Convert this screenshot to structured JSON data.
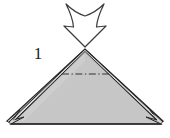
{
  "figure": {
    "step_label": "1",
    "background_color": "#ffffff",
    "paper_fill_color": "#c4c4c4",
    "paper_fill_color_light": "#cccccc",
    "outline_color": "#262626",
    "crease_line_color": "#3a3a3a",
    "arrow_fill_color": "#ffffff",
    "arrow_outline_color": "#3d3d3d"
  },
  "shapes": {
    "arrow": {
      "name": "fold-direction-arrow",
      "direction": "down",
      "style": "hollow-outlined",
      "top_notch": "concave",
      "tip_x": 85,
      "tip_y": 47,
      "top_y": 4,
      "left_barb_x": 64,
      "right_barb_x": 106
    },
    "triangle": {
      "name": "folded-paper-triangle",
      "apex_x": 85,
      "apex_y": 51,
      "left_base_x": 11,
      "left_base_y": 124,
      "right_base_x": 161,
      "right_base_y": 124,
      "layer_offset_px": 5
    },
    "crease": {
      "name": "horizontal-crease-line",
      "style": "dash-dot",
      "y": 74,
      "x_start": 62,
      "x_end": 109
    }
  }
}
